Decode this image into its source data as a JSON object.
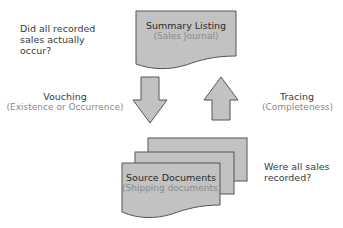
{
  "colors": {
    "shape_fill": "#c2c2c2",
    "shape_stroke": "#555555",
    "dark_text": "#3a3a3a",
    "gray_text": "#8a8a8a"
  },
  "questions": {
    "top_left": [
      "Did all recorded",
      "sales actually",
      "occur?"
    ],
    "bottom_right": [
      "Were all sales",
      "recorded?"
    ]
  },
  "summary_doc": {
    "title": "Summary Listing",
    "subtitle": "(Sales Journal)"
  },
  "source_docs": {
    "title": "Source Documents",
    "subtitle": "(Shipping documents)"
  },
  "vouching": {
    "label": "Vouching",
    "sublabel": "(Existence or Occurrence)",
    "direction": "down"
  },
  "tracing": {
    "label": "Tracing",
    "sublabel": "(Completeness)",
    "direction": "up"
  }
}
